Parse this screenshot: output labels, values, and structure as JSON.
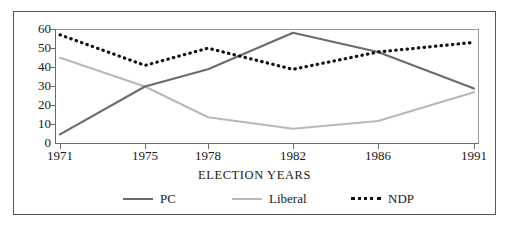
{
  "chart_data": {
    "type": "line",
    "title": "",
    "subtitle": "",
    "xlabel": "ELECTION YEARS",
    "ylabel": "",
    "categories": [
      "1971",
      "1975",
      "1978",
      "1982",
      "1986",
      "1991"
    ],
    "x": [
      1971,
      1975,
      1978,
      1982,
      1986,
      1991
    ],
    "series": [
      {
        "name": "PC",
        "values": [
          5,
          30,
          39,
          58,
          48,
          29
        ],
        "color": "#6b6b6b",
        "style": "solid"
      },
      {
        "name": "Liberal",
        "values": [
          45,
          30,
          14,
          8,
          12,
          27
        ],
        "color": "#b8b8b8",
        "style": "solid"
      },
      {
        "name": "NDP",
        "values": [
          57,
          41,
          50,
          39,
          48,
          53
        ],
        "color": "#111111",
        "style": "dotted"
      }
    ],
    "ylim": [
      0,
      60
    ],
    "yticks": [
      0,
      10,
      20,
      30,
      40,
      50,
      60
    ],
    "ytick_labels": [
      "0",
      "10",
      "20",
      "30",
      "40",
      "50",
      "60"
    ],
    "xlim": [
      1971,
      1991
    ],
    "grid": false,
    "legend_position": "bottom",
    "legend_entries": [
      "PC",
      "Liberal",
      "NDP"
    ]
  },
  "axes": {
    "y_tick_labels": [
      "60",
      "50",
      "40",
      "30",
      "20",
      "10",
      "0"
    ],
    "x_tick_labels": [
      "1971",
      "1975",
      "1978",
      "1982",
      "1986",
      "1991"
    ],
    "x_axis_title": "ELECTION YEARS"
  },
  "legend": {
    "items": [
      {
        "label": "PC",
        "color": "#6b6b6b",
        "style": "solid"
      },
      {
        "label": "Liberal",
        "color": "#b8b8b8",
        "style": "solid"
      },
      {
        "label": "NDP",
        "color": "#111111",
        "style": "dotted"
      }
    ]
  },
  "colors": {
    "pc": "#6b6b6b",
    "liberal": "#b8b8b8",
    "ndp": "#111111",
    "frame": "#555555",
    "axis": "#6b6b6b",
    "text": "#1a1a1a",
    "background": "#ffffff"
  }
}
